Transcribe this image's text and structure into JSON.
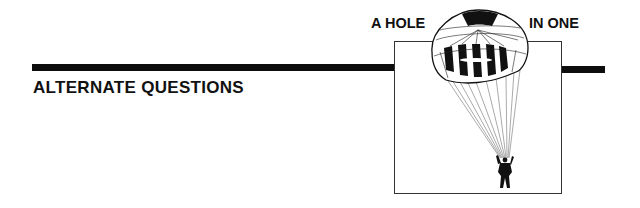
{
  "header": {
    "logo": {
      "text_left": "A HOLE",
      "text_right": "IN ONE",
      "illustration": "parachutist-icon"
    },
    "rule_color": "#0d0d0d"
  },
  "section": {
    "title": "ALTERNATE QUESTIONS"
  }
}
